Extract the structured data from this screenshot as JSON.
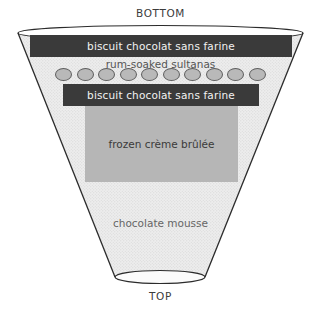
{
  "diagram": {
    "orientation_labels": {
      "top_cap": "BOTTOM",
      "bottom_cap": "TOP"
    },
    "colors": {
      "outline": "#2b2b2b",
      "mold_fill": "#ececec",
      "biscuit_bar": "#3a3a3a",
      "biscuit_text": "#f2f2f2",
      "creme_block": "#b6b6b6",
      "sultana_fill": "#b9b9b9",
      "sultana_stroke": "#5e5e5e",
      "label_text": "#555555",
      "background": "#ffffff"
    },
    "layers": [
      {
        "id": "biscuit-1",
        "label": "biscuit chocolat sans farine",
        "style": "dark-bar"
      },
      {
        "id": "sultanas",
        "label": "rum-soaked sultanas",
        "style": "circle-row",
        "count": 10
      },
      {
        "id": "biscuit-2",
        "label": "biscuit chocolat sans farine",
        "style": "dark-bar"
      },
      {
        "id": "creme-brulee",
        "label": "frozen crème brûlée",
        "style": "grey-block"
      },
      {
        "id": "chocolate-mousse",
        "label": "chocolate mousse",
        "style": "fill-text"
      }
    ]
  }
}
